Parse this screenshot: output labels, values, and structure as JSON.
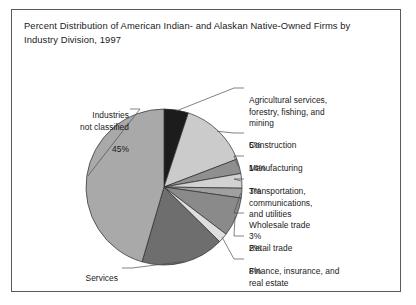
{
  "figure": {
    "title": "Percent Distribution of American Indian- and Alaskan Native-Owned Firms by Industry Division, 1997",
    "border_color": "#5a5a5a",
    "background": "#ffffff"
  },
  "chart_data": {
    "type": "pie",
    "title": "Percent Distribution of American Indian- and Alaskan Native-Owned Firms by Industry Division, 1997",
    "xlabel": "",
    "ylabel": "",
    "units": "percent",
    "start_angle_deg": 0,
    "direction": "clockwise",
    "legend": "none",
    "grid": false,
    "categories": [
      "Agricultural services, forestry, fishing, and mining",
      "Construction",
      "Manufacturing",
      "Transportation, communications, and utilities",
      "Wholesale trade",
      "Retail trade",
      "Finance, insurance, and real estate",
      "Services",
      "Industries not classified"
    ],
    "values": [
      5,
      14,
      3,
      3,
      2,
      8,
      2,
      17,
      45
    ],
    "slices": [
      {
        "label": "Agricultural services, forestry, fishing, and mining",
        "label_lines": "Agricultural services,\nforestry, fishing, and\nmining",
        "value": 5,
        "value_label": "5%",
        "color": "#1c1c1c",
        "side": "right"
      },
      {
        "label": "Construction",
        "label_lines": "Construction",
        "value": 14,
        "value_label": "14%",
        "color": "#cbcbcb",
        "side": "right"
      },
      {
        "label": "Manufacturing",
        "label_lines": "Manufacturing",
        "value": 3,
        "value_label": "3%",
        "color": "#8f8f8f",
        "side": "right"
      },
      {
        "label": "Transportation, communications, and utilities",
        "label_lines": "Transportation,\ncommunications,\nand utilities",
        "value": 3,
        "value_label": "3%",
        "color": "#d2d2d2",
        "side": "right"
      },
      {
        "label": "Wholesale trade",
        "label_lines": "Wholesale trade",
        "value": 2,
        "value_label": "2%",
        "color": "#a0a0a0",
        "side": "right"
      },
      {
        "label": "Retail trade",
        "label_lines": "Retail trade",
        "value": 8,
        "value_label": "8%",
        "color": "#8a8a8a",
        "side": "right"
      },
      {
        "label": "Finance, insurance, and real estate",
        "label_lines": "Finance, insurance, and\nreal estate",
        "value": 2,
        "value_label": "2%",
        "color": "#dedede",
        "side": "right"
      },
      {
        "label": "Services",
        "label_lines": "Services",
        "value": 17,
        "value_label": "17%",
        "color": "#6e6e6e",
        "side": "bottom-left"
      },
      {
        "label": "Industries not classified",
        "label_lines": "Industries\nnot classified",
        "value": 45,
        "value_label": "45%",
        "color": "#a9a9a9",
        "side": "left"
      }
    ]
  }
}
